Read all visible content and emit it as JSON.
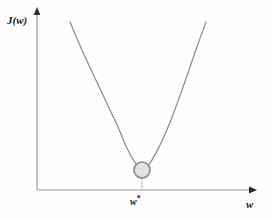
{
  "figure": {
    "background_color": "#fefefe",
    "axis_color": "#9a9a9a",
    "curve_color": "#8c8c8c",
    "marker_fill": "#e3e3e3",
    "marker_stroke": "#8a8a8a",
    "dotted_line_color": "#b5b5b5",
    "arrow_color": "#2b2b2b",
    "label_color": "#222222"
  },
  "labels": {
    "y_axis": "J(w)",
    "x_axis": "w",
    "optimum_base": "w",
    "optimum_superscript": "*"
  },
  "chart_data": {
    "type": "line",
    "title": "",
    "xlabel": "w",
    "ylabel": "J(w)",
    "grid": false,
    "legend": false,
    "axis_arrows": true,
    "curve_name": "J(w)",
    "curve_shape": "parabola",
    "vertex": {
      "x": 142,
      "y": 170
    },
    "x_start_px": 70,
    "x_end_px": 206,
    "y_top_px": 22,
    "points_px": [
      {
        "x": 70,
        "y": 22
      },
      {
        "x": 78,
        "y": 41
      },
      {
        "x": 86,
        "y": 59
      },
      {
        "x": 94,
        "y": 76
      },
      {
        "x": 102,
        "y": 93
      },
      {
        "x": 110,
        "y": 110
      },
      {
        "x": 118,
        "y": 127
      },
      {
        "x": 126,
        "y": 146
      },
      {
        "x": 134,
        "y": 161
      },
      {
        "x": 142,
        "y": 170
      },
      {
        "x": 150,
        "y": 163
      },
      {
        "x": 158,
        "y": 149
      },
      {
        "x": 166,
        "y": 132
      },
      {
        "x": 174,
        "y": 112
      },
      {
        "x": 182,
        "y": 90
      },
      {
        "x": 190,
        "y": 67
      },
      {
        "x": 198,
        "y": 44
      },
      {
        "x": 206,
        "y": 22
      }
    ],
    "marker": {
      "shape": "circle",
      "label": "w*",
      "center_px": {
        "x": 142,
        "y": 170
      },
      "radius_px": 8
    },
    "dotted_guide": {
      "from_px": {
        "x": 142,
        "y": 178
      },
      "to_px": {
        "x": 142,
        "y": 190
      }
    },
    "axes_px": {
      "origin": {
        "x": 37,
        "y": 190
      },
      "y_axis_top": {
        "x": 37,
        "y": 12
      },
      "x_axis_right": {
        "x": 252,
        "y": 190
      }
    }
  }
}
